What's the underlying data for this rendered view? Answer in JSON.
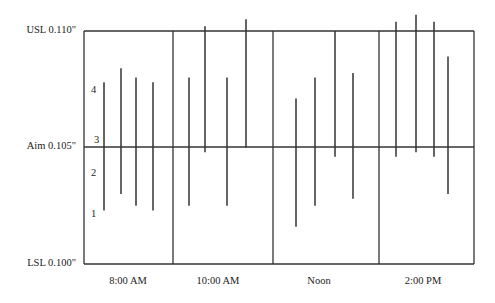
{
  "chart_data": {
    "type": "range-bar",
    "title": "",
    "xlabel": "",
    "ylabel": "",
    "ylim": [
      0.1,
      0.11
    ],
    "grid": false,
    "legend": null,
    "reference_lines": [
      {
        "name": "USL",
        "label": "USL 0.110\"",
        "value": 0.11
      },
      {
        "name": "Aim",
        "label": "Aim  0.105\"",
        "value": 0.105
      },
      {
        "name": "LSL",
        "label": "LSL 0.100\"",
        "value": 0.1
      }
    ],
    "zone_labels": [
      {
        "label": "4",
        "value": 0.1072
      },
      {
        "label": "3",
        "value": 0.1055
      },
      {
        "label": "2",
        "value": 0.1038
      },
      {
        "label": "1",
        "value": 0.1021
      }
    ],
    "categories": [
      "8:00 AM",
      "10:00 AM",
      "Noon",
      "2:00 PM"
    ],
    "series": [
      {
        "name": "8:00 AM",
        "ranges": [
          [
            0.1023,
            0.1078
          ],
          [
            0.103,
            0.1084
          ],
          [
            0.1025,
            0.108
          ],
          [
            0.1023,
            0.1078
          ]
        ]
      },
      {
        "name": "10:00 AM",
        "ranges": [
          [
            0.1025,
            0.108
          ],
          [
            0.1048,
            0.1102
          ],
          [
            0.1025,
            0.108
          ],
          [
            0.105,
            0.1105
          ]
        ]
      },
      {
        "name": "Noon",
        "ranges": [
          [
            0.1016,
            0.1071
          ],
          [
            0.1025,
            0.108
          ],
          [
            0.1046,
            0.11
          ],
          [
            0.1028,
            0.1082
          ]
        ]
      },
      {
        "name": "2:00 PM",
        "ranges": [
          [
            0.1046,
            0.1104
          ],
          [
            0.1048,
            0.1107
          ],
          [
            0.1046,
            0.1104
          ],
          [
            0.103,
            0.1089
          ]
        ]
      }
    ]
  },
  "labels": {
    "usl": "USL 0.110\"",
    "aim": "Aim  0.105\"",
    "lsl": "LSL 0.100\"",
    "zone4": "4",
    "zone3": "3",
    "zone2": "2",
    "zone1": "1",
    "x0": "8:00 AM",
    "x1": "10:00 AM",
    "x2": "Noon",
    "x3": "2:00 PM"
  },
  "colors": {
    "line": "#333333",
    "background": "#ffffff"
  }
}
